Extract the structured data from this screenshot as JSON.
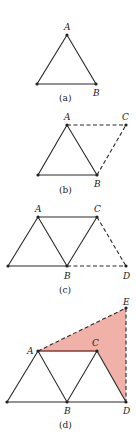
{
  "figure": {
    "panels": [
      {
        "caption": "(a)",
        "labels": {
          "A": "A",
          "B": "B"
        }
      },
      {
        "caption": "(b)",
        "labels": {
          "A": "A",
          "B": "B",
          "C": "C"
        }
      },
      {
        "caption": "(c)",
        "labels": {
          "A": "A",
          "B": "B",
          "C": "C",
          "D": "D"
        }
      },
      {
        "caption": "(d)",
        "labels": {
          "A": "A",
          "B": "B",
          "C": "C",
          "D": "D",
          "E": "E"
        }
      }
    ],
    "colors": {
      "shade": "#f0b2a8",
      "line": "#2a2a2a",
      "highlight": "#8a3a32"
    }
  }
}
